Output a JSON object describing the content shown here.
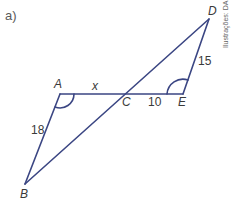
{
  "item_label": "a)",
  "credit": "Ilustrações: DAE",
  "colors": {
    "line": "#3b4683",
    "text": "#3a3a3a",
    "label_part": "#4d9a4d"
  },
  "points": {
    "A": {
      "label": "A",
      "x": 60,
      "y": 94
    },
    "C": {
      "label": "C",
      "x": 127,
      "y": 94
    },
    "E": {
      "label": "E",
      "x": 183,
      "y": 94
    },
    "D": {
      "label": "D",
      "x": 209,
      "y": 19
    },
    "B": {
      "label": "B",
      "x": 25,
      "y": 184
    }
  },
  "segments": {
    "AC": "x",
    "CE": "10",
    "DE": "15",
    "AB": "18"
  }
}
